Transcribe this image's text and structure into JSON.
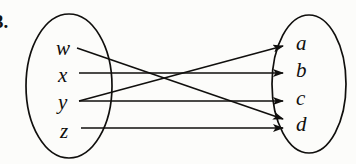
{
  "figure": {
    "problem_number": "3.",
    "type": "function-mapping-diagram",
    "stroke_color": "#100f0d",
    "background_color": "#fcfcfa",
    "domain_set": {
      "name": "domain-ellipse",
      "elements": [
        {
          "id": "w",
          "label": "w"
        },
        {
          "id": "x",
          "label": "x"
        },
        {
          "id": "y",
          "label": "y"
        },
        {
          "id": "z",
          "label": "z"
        }
      ]
    },
    "codomain_set": {
      "name": "codomain-ellipse",
      "elements": [
        {
          "id": "a",
          "label": "a"
        },
        {
          "id": "b",
          "label": "b"
        },
        {
          "id": "c",
          "label": "c"
        },
        {
          "id": "d",
          "label": "d"
        }
      ]
    },
    "mappings": [
      {
        "from": "w",
        "to": "d"
      },
      {
        "from": "x",
        "to": "b"
      },
      {
        "from": "y",
        "to": "a"
      },
      {
        "from": "y",
        "to": "c"
      },
      {
        "from": "z",
        "to": "d"
      }
    ]
  }
}
